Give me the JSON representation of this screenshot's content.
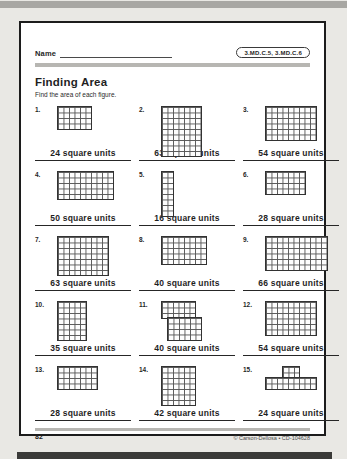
{
  "surface": {
    "top_strip_color": "#a8a7a3",
    "bottom_strip_color": "#3a3a38",
    "page_background": "#ffffff"
  },
  "header": {
    "name_label": "Name",
    "standards_badge": "3.MD.C.5, 3.MD.C.6"
  },
  "worksheet": {
    "title": "Finding Area",
    "instructions": "Find the area of each figure."
  },
  "problems": [
    {
      "number": "1.",
      "answer": "24 square units",
      "figure": {
        "unit": "square grid",
        "blocks": [
          [
            0,
            0,
            6,
            4
          ]
        ]
      }
    },
    {
      "number": "2.",
      "answer": "63 square units",
      "figure": {
        "unit": "square grid",
        "blocks": [
          [
            0,
            0,
            7,
            9
          ]
        ]
      }
    },
    {
      "number": "3.",
      "answer": "54 square units",
      "figure": {
        "unit": "square grid",
        "blocks": [
          [
            0,
            0,
            9,
            6
          ]
        ]
      }
    },
    {
      "number": "4.",
      "answer": "50 square units",
      "figure": {
        "unit": "square grid",
        "blocks": [
          [
            0,
            0,
            10,
            5
          ]
        ]
      }
    },
    {
      "number": "5.",
      "answer": "16 square units",
      "figure": {
        "unit": "square grid",
        "blocks": [
          [
            0,
            0,
            2,
            8
          ]
        ]
      }
    },
    {
      "number": "6.",
      "answer": "28 square units",
      "figure": {
        "unit": "square grid",
        "blocks": [
          [
            0,
            0,
            7,
            4
          ]
        ]
      }
    },
    {
      "number": "7.",
      "answer": "63 square units",
      "figure": {
        "unit": "square grid",
        "blocks": [
          [
            0,
            0,
            9,
            7
          ]
        ]
      }
    },
    {
      "number": "8.",
      "answer": "40 square units",
      "figure": {
        "unit": "square grid",
        "blocks": [
          [
            0,
            0,
            8,
            5
          ]
        ]
      }
    },
    {
      "number": "9.",
      "answer": "66 square units",
      "figure": {
        "unit": "square grid",
        "blocks": [
          [
            0,
            0,
            11,
            6
          ]
        ]
      }
    },
    {
      "number": "10.",
      "answer": "35 square units",
      "figure": {
        "unit": "square grid",
        "blocks": [
          [
            0,
            0,
            5,
            7
          ]
        ]
      }
    },
    {
      "number": "11.",
      "answer": "40 square units",
      "figure": {
        "unit": "square grid",
        "blocks": [
          [
            0,
            0,
            6,
            3
          ],
          [
            1,
            3,
            6,
            4
          ]
        ]
      }
    },
    {
      "number": "12.",
      "answer": "54 square units",
      "figure": {
        "unit": "square grid",
        "blocks": [
          [
            0,
            0,
            9,
            6
          ]
        ]
      }
    },
    {
      "number": "13.",
      "answer": "28 square units",
      "figure": {
        "unit": "square grid",
        "blocks": [
          [
            0,
            0,
            7,
            4
          ]
        ]
      }
    },
    {
      "number": "14.",
      "answer": "42 square units",
      "figure": {
        "unit": "square grid",
        "blocks": [
          [
            0,
            0,
            6,
            7
          ]
        ]
      }
    },
    {
      "number": "15.",
      "answer": "24 square units",
      "figure": {
        "unit": "square grid",
        "blocks": [
          [
            3,
            0,
            3,
            2
          ],
          [
            0,
            2,
            9,
            2
          ]
        ]
      }
    }
  ],
  "footer": {
    "page_number": "82",
    "copyright": "© Carson-Dellosa • CD-104628"
  }
}
